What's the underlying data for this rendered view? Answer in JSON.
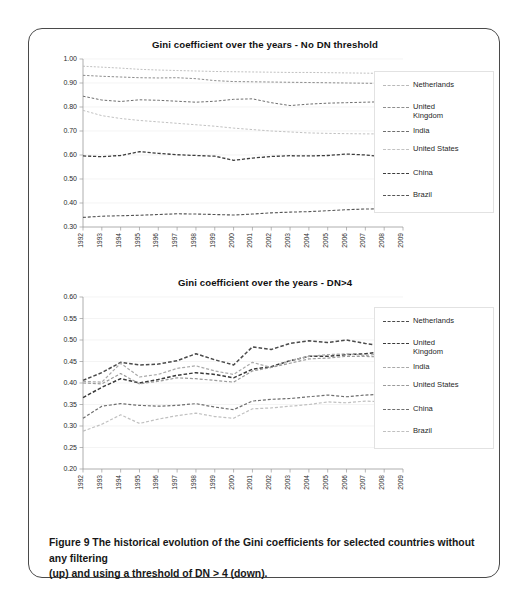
{
  "figure": {
    "caption_lines": [
      "Figure 9  The historical evolution of the Gini coefficients for selected countries without any filtering",
      "(up) and using a threshold of DN > 4 (down)."
    ]
  },
  "legend_common": {
    "entries": [
      "Netherlands",
      "United\nKingdom",
      "India",
      "United States",
      "China",
      "Brazil"
    ]
  },
  "chart_data": [
    {
      "id": "top",
      "type": "line",
      "title": "Gini coefficient over the years - No DN threshold",
      "xlabel": "",
      "ylabel": "",
      "xlim": [
        1992,
        2009
      ],
      "ylim": [
        0.3,
        1.0
      ],
      "ytick_step": 0.1,
      "grid": true,
      "legend_position": "right",
      "x": [
        1992,
        1993,
        1994,
        1995,
        1996,
        1997,
        1998,
        1999,
        2000,
        2001,
        2002,
        2003,
        2004,
        2005,
        2006,
        2007,
        2008,
        2009
      ],
      "ytick_labels": [
        "0.30",
        "0.40",
        "0.50",
        "0.60",
        "0.70",
        "0.80",
        "0.90",
        "1.00"
      ],
      "xtick_labels": [
        "1992",
        "1993",
        "1994",
        "1995",
        "1996",
        "1997",
        "1998",
        "1999",
        "2000",
        "2001",
        "2002",
        "2003",
        "2004",
        "2005",
        "2006",
        "2007",
        "2008",
        "2009"
      ],
      "series": [
        {
          "name": "Netherlands",
          "values": [
            0.97,
            0.966,
            0.962,
            0.957,
            0.954,
            0.952,
            0.95,
            0.948,
            0.947,
            0.946,
            0.945,
            0.944,
            0.944,
            0.943,
            0.942,
            0.941,
            0.94,
            0.939
          ]
        },
        {
          "name": "United Kingdom",
          "values": [
            0.932,
            0.928,
            0.925,
            0.922,
            0.921,
            0.922,
            0.918,
            0.91,
            0.906,
            0.905,
            0.904,
            0.903,
            0.902,
            0.901,
            0.9,
            0.899,
            0.898,
            0.897
          ]
        },
        {
          "name": "India",
          "values": [
            0.845,
            0.829,
            0.823,
            0.83,
            0.828,
            0.824,
            0.82,
            0.824,
            0.832,
            0.834,
            0.818,
            0.806,
            0.812,
            0.816,
            0.818,
            0.82,
            0.822,
            0.823
          ]
        },
        {
          "name": "United States",
          "values": [
            0.786,
            0.764,
            0.752,
            0.744,
            0.738,
            0.732,
            0.726,
            0.72,
            0.712,
            0.706,
            0.7,
            0.696,
            0.692,
            0.69,
            0.689,
            0.688,
            0.688,
            0.687
          ]
        },
        {
          "name": "China",
          "values": [
            0.596,
            0.593,
            0.598,
            0.614,
            0.607,
            0.601,
            0.598,
            0.595,
            0.578,
            0.587,
            0.594,
            0.597,
            0.596,
            0.598,
            0.604,
            0.6,
            0.592,
            0.586
          ]
        },
        {
          "name": "Brazil",
          "values": [
            0.34,
            0.345,
            0.347,
            0.349,
            0.352,
            0.355,
            0.354,
            0.352,
            0.35,
            0.354,
            0.359,
            0.362,
            0.364,
            0.368,
            0.372,
            0.375,
            0.376,
            0.378
          ]
        }
      ]
    },
    {
      "id": "bottom",
      "type": "line",
      "title": "Gini coefficient over the years - DN>4",
      "xlabel": "",
      "ylabel": "",
      "xlim": [
        1992,
        2009
      ],
      "ylim": [
        0.2,
        0.6
      ],
      "ytick_step": 0.05,
      "grid": true,
      "legend_position": "right",
      "x": [
        1992,
        1993,
        1994,
        1995,
        1996,
        1997,
        1998,
        1999,
        2000,
        2001,
        2002,
        2003,
        2004,
        2005,
        2006,
        2007,
        2008,
        2009
      ],
      "ytick_labels": [
        "0.20",
        "0.25",
        "0.30",
        "0.35",
        "0.40",
        "0.45",
        "0.50",
        "0.55",
        "0.60"
      ],
      "xtick_labels": [
        "1992",
        "1993",
        "1994",
        "1995",
        "1996",
        "1997",
        "1998",
        "1999",
        "2000",
        "2001",
        "2002",
        "2003",
        "2004",
        "2005",
        "2006",
        "2007",
        "2008",
        "2009"
      ],
      "series": [
        {
          "name": "Netherlands",
          "values": [
            0.406,
            0.424,
            0.448,
            0.442,
            0.444,
            0.452,
            0.468,
            0.454,
            0.442,
            0.484,
            0.478,
            0.492,
            0.498,
            0.494,
            0.5,
            0.492,
            0.486,
            0.47
          ]
        },
        {
          "name": "United Kingdom",
          "values": [
            0.366,
            0.39,
            0.41,
            0.4,
            0.408,
            0.418,
            0.424,
            0.42,
            0.412,
            0.432,
            0.438,
            0.452,
            0.462,
            0.462,
            0.466,
            0.468,
            0.474,
            0.438
          ]
        },
        {
          "name": "India",
          "values": [
            0.404,
            0.402,
            0.446,
            0.414,
            0.42,
            0.434,
            0.44,
            0.428,
            0.42,
            0.448,
            0.436,
            0.452,
            0.462,
            0.466,
            0.468,
            0.464,
            0.468,
            0.452
          ]
        },
        {
          "name": "United States",
          "values": [
            0.4,
            0.398,
            0.422,
            0.398,
            0.404,
            0.412,
            0.41,
            0.406,
            0.402,
            0.428,
            0.436,
            0.446,
            0.456,
            0.458,
            0.462,
            0.462,
            0.46,
            0.446
          ]
        },
        {
          "name": "China",
          "values": [
            0.318,
            0.346,
            0.352,
            0.348,
            0.346,
            0.348,
            0.352,
            0.344,
            0.338,
            0.358,
            0.362,
            0.364,
            0.368,
            0.372,
            0.368,
            0.372,
            0.374,
            0.36
          ]
        },
        {
          "name": "Brazil",
          "values": [
            0.288,
            0.304,
            0.326,
            0.306,
            0.316,
            0.324,
            0.33,
            0.322,
            0.318,
            0.34,
            0.342,
            0.346,
            0.35,
            0.356,
            0.354,
            0.358,
            0.356,
            0.336
          ]
        }
      ]
    }
  ]
}
